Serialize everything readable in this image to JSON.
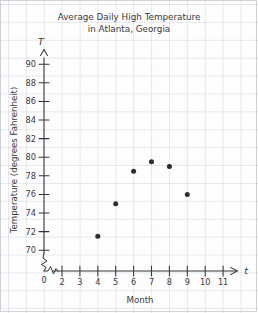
{
  "chart_data": {
    "type": "scatter",
    "title": "Average Daily High Temperature in Atlanta, Georgia",
    "title_line1": "Average Daily High Temperature",
    "title_line2": "in Atlanta, Georgia",
    "xlabel": "Month",
    "ylabel": "Temperature (degrees Fahrenheit)",
    "x_axis_variable": "t",
    "y_axis_variable": "T",
    "x": [
      4,
      5,
      6,
      7,
      8,
      9
    ],
    "values": [
      73,
      80,
      87,
      89,
      88,
      82
    ],
    "points": [
      {
        "x": 4,
        "y": 73
      },
      {
        "x": 5,
        "y": 80
      },
      {
        "x": 6,
        "y": 87
      },
      {
        "x": 7,
        "y": 89
      },
      {
        "x": 8,
        "y": 88
      },
      {
        "x": 9,
        "y": 82
      }
    ],
    "xlim": [
      2,
      11
    ],
    "ylim": [
      70,
      90
    ],
    "x_ticks": [
      2,
      3,
      4,
      5,
      6,
      7,
      8,
      9,
      10,
      11
    ],
    "x_tick_labels": [
      "2",
      "3",
      "4",
      "5",
      "6",
      "7",
      "8",
      "9",
      "10",
      "11"
    ],
    "y_ticks": [
      70,
      72,
      74,
      76,
      78,
      80,
      82,
      84,
      86,
      88,
      90
    ],
    "y_tick_labels": [
      "70",
      "72",
      "74",
      "76",
      "78",
      "80",
      "82",
      "84",
      "86",
      "88",
      "90"
    ],
    "origin_label": "0",
    "x_axis_break": true,
    "y_axis_break": true,
    "grid": true,
    "legend": null,
    "point_color": "#2b2b31",
    "axis_color": "#35353b",
    "grid_color": "#8c96a5",
    "background_color": "#fdfdfd"
  },
  "origin": {
    "label": "0"
  }
}
